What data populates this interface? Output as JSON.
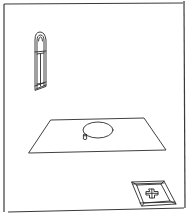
{
  "diagram": {
    "type": "perspective-line-drawing",
    "colors": {
      "background": "#ffffff",
      "stroke": "#2a2a2a",
      "frame": "#3a3a3a"
    },
    "elements": [
      {
        "id": "frame",
        "label": ""
      },
      {
        "id": "arched-window",
        "label": ""
      },
      {
        "id": "floor-plane",
        "label": ""
      },
      {
        "id": "ellipse",
        "label": ""
      },
      {
        "id": "small-cylinder",
        "label": ""
      },
      {
        "id": "cross-tile",
        "label": ""
      }
    ]
  }
}
